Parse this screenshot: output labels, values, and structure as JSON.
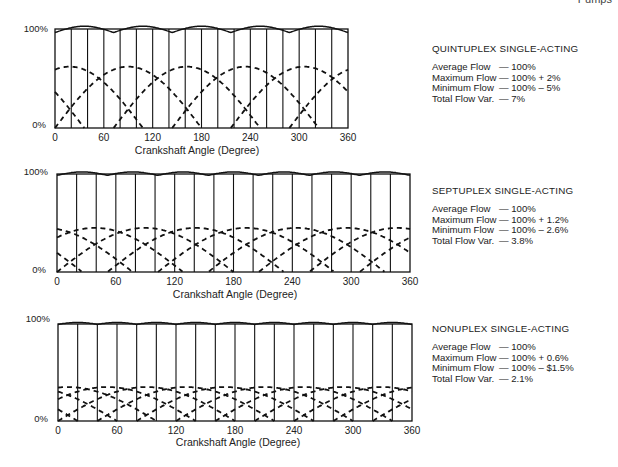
{
  "page": {
    "header_fragment": "Pumps"
  },
  "chart_data": [
    {
      "type": "line",
      "title": "QUINTUPLEX SINGLE-ACTING",
      "xlabel": "Crankshaft Angle (Degree)",
      "ylabel": "",
      "x_ticks": [
        "0",
        "60",
        "120",
        "180",
        "240",
        "300",
        "360"
      ],
      "y_ticks": [
        "0%",
        "100%"
      ],
      "xlim": [
        0,
        360
      ],
      "ylim": [
        0,
        100
      ],
      "grid_vertical_every_deg": 20,
      "cylinders": 5,
      "phase_spacing_deg": 72,
      "individual_peak_pct": 62,
      "series": [
        {
          "name": "Total flow",
          "style": "solid",
          "mean_pct": 100,
          "ripple_max_pct": 2,
          "ripple_min_pct": -5
        },
        {
          "name": "Individual cylinder flow",
          "style": "dashed",
          "shape": "half-sine per cylinder, 180° duration"
        }
      ],
      "stats": [
        {
          "label": "Average Flow",
          "value": "— 100%"
        },
        {
          "label": "Maximum Flow",
          "value": "— 100%  +  2%"
        },
        {
          "label": "Minimum Flow",
          "value": "— 100%  –  5%"
        },
        {
          "label": "Total Flow Var.",
          "value": "— 7%"
        }
      ]
    },
    {
      "type": "line",
      "title": "SEPTUPLEX SINGLE-ACTING",
      "xlabel": "Crankshaft Angle (Degree)",
      "ylabel": "",
      "x_ticks": [
        "0",
        "60",
        "120",
        "180",
        "240",
        "300",
        "360"
      ],
      "y_ticks": [
        "0%",
        "100%"
      ],
      "xlim": [
        0,
        360
      ],
      "ylim": [
        0,
        100
      ],
      "grid_vertical_every_deg": 20,
      "cylinders": 7,
      "phase_spacing_deg": 51.4,
      "individual_peak_pct": 45,
      "series": [
        {
          "name": "Total flow",
          "style": "solid",
          "mean_pct": 100,
          "ripple_max_pct": 1.2,
          "ripple_min_pct": -2.6
        },
        {
          "name": "Individual cylinder flow",
          "style": "dashed",
          "shape": "half-sine per cylinder, 180° duration"
        }
      ],
      "stats": [
        {
          "label": "Average Flow",
          "value": "— 100%"
        },
        {
          "label": "Maximum Flow",
          "value": "— 100%  +  1.2%"
        },
        {
          "label": "Minimum Flow",
          "value": "— 100%  –  2.6%"
        },
        {
          "label": "Total Flow Var.",
          "value": "— 3.8%"
        }
      ]
    },
    {
      "type": "line",
      "title": "NONUPLEX SINGLE-ACTING",
      "xlabel": "Crankshaft Angle (Degree)",
      "ylabel": "",
      "x_ticks": [
        "0",
        "60",
        "120",
        "180",
        "240",
        "300",
        "360"
      ],
      "y_ticks": [
        "0%",
        "100%"
      ],
      "xlim": [
        0,
        360
      ],
      "ylim": [
        0,
        100
      ],
      "grid_vertical_every_deg": 20,
      "cylinders": 9,
      "phase_spacing_deg": 40,
      "individual_peak_pct": 35,
      "series": [
        {
          "name": "Total flow",
          "style": "solid",
          "mean_pct": 100,
          "ripple_max_pct": 0.6,
          "ripple_min_pct": -1.5
        },
        {
          "name": "Individual cylinder flow",
          "style": "dashed",
          "shape": "half-sine per cylinder, 180° duration"
        }
      ],
      "stats": [
        {
          "label": "Average Flow",
          "value": "— 100%"
        },
        {
          "label": "Maximum Flow",
          "value": "— 100%  +  0.6%"
        },
        {
          "label": "Minimum Flow",
          "value": "— 100%  –  $1.5%"
        },
        {
          "label": "Total Flow Var.",
          "value": "— 2.1%"
        }
      ]
    }
  ]
}
